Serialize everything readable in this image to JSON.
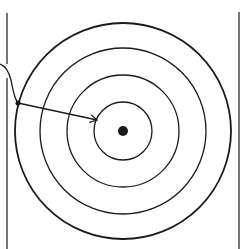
{
  "diagram": {
    "type": "concentric-target",
    "background": "#ffffff",
    "stroke_color": "#1a1a1a",
    "center": {
      "x": 123,
      "y": 131
    },
    "rings": [
      {
        "name": "ring-1",
        "radius": 29,
        "stroke_width": 1.3
      },
      {
        "name": "ring-2",
        "radius": 56,
        "stroke_width": 1.3
      },
      {
        "name": "ring-3",
        "radius": 83,
        "stroke_width": 1.3
      },
      {
        "name": "ring-4",
        "radius": 108,
        "stroke_width": 1.8
      }
    ],
    "center_dot": {
      "radius": 5
    },
    "boundary_lines": {
      "left": {
        "x": 7,
        "y_start": 13,
        "y_end": 249,
        "gap": [
          64,
          78
        ]
      },
      "right": {
        "x": 239,
        "y_start": 12,
        "y_end": 249
      }
    },
    "entry_curve": {
      "path": "M0,64 C6,66 9,72 11,80 C13,90 14,98 18,103"
    },
    "start_point": {
      "x": 18,
      "y": 103,
      "radius": 2.5
    },
    "arrow": {
      "from": {
        "x": 18,
        "y": 103
      },
      "to": {
        "x": 97,
        "y": 120
      }
    }
  }
}
